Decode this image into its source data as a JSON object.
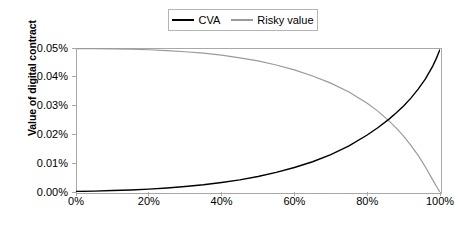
{
  "chart_data": {
    "type": "line",
    "title": "",
    "xlabel": "Correlation",
    "ylabel": "Value of digital contract",
    "xlim": [
      0,
      100
    ],
    "ylim": [
      0,
      0.05
    ],
    "xticks": [
      "0%",
      "20%",
      "40%",
      "60%",
      "80%",
      "100%"
    ],
    "xtick_values": [
      0,
      20,
      40,
      60,
      80,
      100
    ],
    "yticks": [
      "0.00%",
      "0.01%",
      "0.02%",
      "0.03%",
      "0.04%",
      "0.05%"
    ],
    "ytick_values": [
      0.0,
      0.01,
      0.02,
      0.03,
      0.04,
      0.05
    ],
    "grid": false,
    "legend_position": "top-center",
    "x": [
      0,
      5,
      10,
      15,
      20,
      25,
      30,
      35,
      40,
      45,
      50,
      55,
      60,
      65,
      70,
      75,
      80,
      83,
      86,
      88,
      90,
      92,
      94,
      96,
      98,
      99,
      100
    ],
    "series": [
      {
        "name": "CVA",
        "color": "#000000",
        "values": [
          0.0002,
          0.0003,
          0.0005,
          0.0007,
          0.001,
          0.0014,
          0.0019,
          0.0025,
          0.0033,
          0.0042,
          0.0054,
          0.0068,
          0.0085,
          0.0105,
          0.013,
          0.016,
          0.0198,
          0.0224,
          0.0253,
          0.0275,
          0.0299,
          0.0326,
          0.0357,
          0.0393,
          0.0437,
          0.0464,
          0.0495
        ]
      },
      {
        "name": "Risky value",
        "color": "#9a9a9a",
        "values": [
          0.0498,
          0.0498,
          0.0497,
          0.0496,
          0.0494,
          0.0491,
          0.0487,
          0.0482,
          0.0475,
          0.0466,
          0.0455,
          0.0441,
          0.0424,
          0.0403,
          0.0378,
          0.0347,
          0.0308,
          0.028,
          0.0247,
          0.0222,
          0.0194,
          0.0162,
          0.0127,
          0.0087,
          0.0042,
          0.002,
          0.0
        ]
      }
    ],
    "annotations": [
      {
        "text": "curves cross near 87% correlation at about 0.025%"
      }
    ]
  },
  "legend": {
    "entries": [
      {
        "label": "CVA",
        "color": "#000000"
      },
      {
        "label": "Risky value",
        "color": "#9a9a9a"
      }
    ]
  },
  "axes": {
    "x_title": "Correlation",
    "y_title": "Value of digital contract"
  },
  "colors": {
    "cva_line": "#000000",
    "risky_line": "#9a9a9a",
    "frame": "#a8a8a8",
    "background": "#ffffff"
  }
}
